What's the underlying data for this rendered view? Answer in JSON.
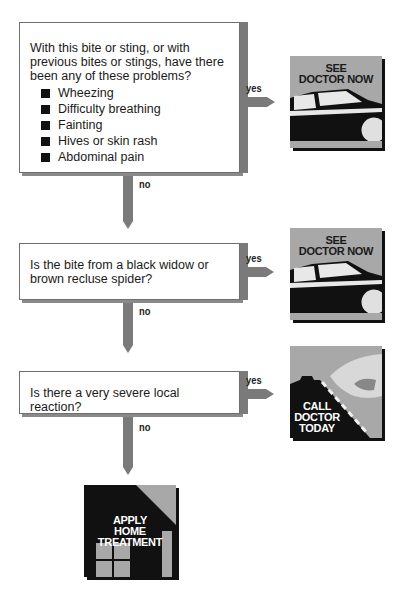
{
  "flowchart": {
    "questions": [
      {
        "text": "With this bite or sting, or with previous bites or stings, have there been any of these problems?",
        "bullets": [
          "Wheezing",
          "Difficulty breathing",
          "Fainting",
          "Hives or skin rash",
          "Abdominal pain"
        ],
        "yes_label": "yes",
        "no_label": "no",
        "yes_outcome": "SEE DOCTOR NOW"
      },
      {
        "text": "Is the bite from a black widow or brown recluse spider?",
        "yes_label": "yes",
        "no_label": "no",
        "yes_outcome": "SEE DOCTOR NOW"
      },
      {
        "text": "Is there a very severe local reaction?",
        "yes_label": "yes",
        "no_label": "no",
        "yes_outcome": "CALL DOCTOR TODAY"
      }
    ],
    "final_outcome": "APPLY HOME TREATMENT",
    "outcomes": {
      "see_doctor_line1": "SEE",
      "see_doctor_line2": "DOCTOR NOW",
      "call_line1": "CALL",
      "call_line2": "DOCTOR",
      "call_line3": "TODAY",
      "home_line1": "APPLY",
      "home_line2": "HOME",
      "home_line3": "TREATMENT"
    },
    "colors": {
      "arrow": "#7a7a7a",
      "card_bg": "#a8a8a8",
      "card_dark": "#111111"
    }
  }
}
